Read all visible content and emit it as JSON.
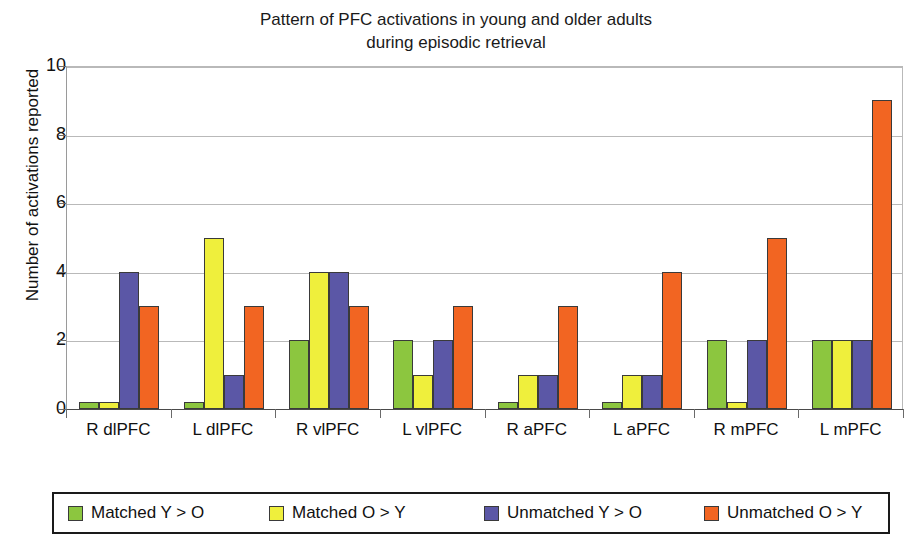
{
  "chart_data": {
    "type": "bar",
    "title": "Pattern of PFC activations in young and older adults\nduring episodic retrieval",
    "title_line1": "Pattern of PFC activations in young and older adults",
    "title_line2": "during episodic retrieval",
    "xlabel": "",
    "ylabel": "Number of activations reported",
    "ylim": [
      0,
      10
    ],
    "ytick_labels": [
      "0",
      "2",
      "4",
      "6",
      "8",
      "10"
    ],
    "yticks": [
      0,
      2,
      4,
      6,
      8,
      10
    ],
    "grid": "horizontal",
    "legend_position": "bottom",
    "categories": [
      "R dlPFC",
      "L dlPFC",
      "R vlPFC",
      "L vlPFC",
      "R aPFC",
      "L aPFC",
      "R mPFC",
      "L mPFC"
    ],
    "series": [
      {
        "name": "Matched Y > O",
        "color": "#8CC63F",
        "values": [
          0.2,
          0.2,
          2,
          2,
          0.2,
          0.2,
          2,
          2
        ]
      },
      {
        "name": "Matched O > Y",
        "color": "#EFEF3C",
        "values": [
          0.2,
          5,
          4,
          1,
          1,
          1,
          0.2,
          2
        ]
      },
      {
        "name": "Unmatched Y > O",
        "color": "#5B57A6",
        "values": [
          4,
          1,
          4,
          2,
          1,
          1,
          2,
          2
        ]
      },
      {
        "name": "Unmatched O > Y",
        "color": "#F26522",
        "values": [
          3,
          3,
          3,
          3,
          3,
          4,
          5,
          9
        ]
      }
    ]
  }
}
